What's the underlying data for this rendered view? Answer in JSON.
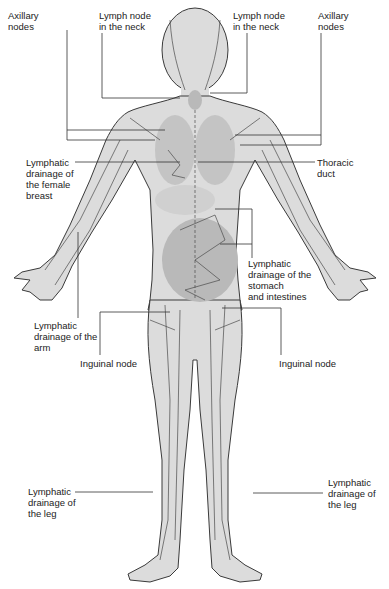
{
  "diagram": {
    "colors": {
      "skin": "#dcdcdc",
      "skin_dark": "#c4c4c4",
      "organ": "#b9b9b9",
      "outline": "#3a3a3a",
      "vessel": "#4a4a4a",
      "leader": "#333333",
      "text": "#222222"
    },
    "labels": {
      "axillary_left": "Axillary\nnodes",
      "neck_left": "Lymph node\nin the neck",
      "neck_right": "Lymph node\nin the neck",
      "axillary_right": "Axillary\nnodes",
      "breast": "Lymphatic\ndrainage of the female\nbreast",
      "thoracic": "Thoracic\nduct",
      "stomach": "Lymphatic\ndrainage of the\nstomach\nand intestines",
      "arm": "Lymphatic\ndrainage of the\narm",
      "inguinal_left": "Inguinal node",
      "inguinal_right": "Inguinal node",
      "leg_left": "Lymphatic\ndrainage of\nthe leg",
      "leg_right": "Lymphatic\ndrainage of\nthe leg"
    }
  }
}
